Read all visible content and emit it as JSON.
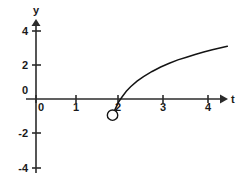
{
  "chart_data": {
    "type": "line",
    "title": "",
    "subtitle": "",
    "xlabel": "t",
    "ylabel": "y",
    "xlim": [
      -0.25,
      4.55
    ],
    "ylim": [
      -4.6,
      4.6
    ],
    "grid": false,
    "legend": null,
    "x_ticks": [
      0,
      1,
      2,
      3,
      4
    ],
    "x_tick_labels": [
      "0",
      "1",
      "2",
      "3",
      "4"
    ],
    "y_ticks": [
      4,
      2,
      0,
      -2,
      -4
    ],
    "y_tick_labels": [
      "4",
      "2",
      "0",
      "-2",
      "-4"
    ],
    "annotations": [
      {
        "name": "open-endpoint",
        "kind": "open-circle",
        "x": 1.78,
        "y": -0.95,
        "label": ""
      }
    ],
    "series": [
      {
        "name": "curve",
        "style": "solid",
        "color": "#141414",
        "x": [
          1.78,
          1.85,
          1.92,
          2.0,
          2.1,
          2.2,
          2.35,
          2.5,
          2.7,
          2.9,
          3.1,
          3.3,
          3.5,
          3.7,
          3.9,
          4.1,
          4.3,
          4.45
        ],
        "y": [
          -0.95,
          -0.55,
          -0.18,
          0.12,
          0.45,
          0.72,
          1.05,
          1.32,
          1.62,
          1.88,
          2.1,
          2.3,
          2.46,
          2.62,
          2.76,
          2.9,
          3.02,
          3.1
        ]
      }
    ]
  },
  "axes": {
    "x_axis_name": "t",
    "y_axis_name": "y",
    "x_origin_label": "0",
    "y_origin_label": "0"
  },
  "colors": {
    "axis": "#2b2b2b",
    "curve": "#141414",
    "text": "#1a1a1a",
    "background": "#ffffff"
  }
}
